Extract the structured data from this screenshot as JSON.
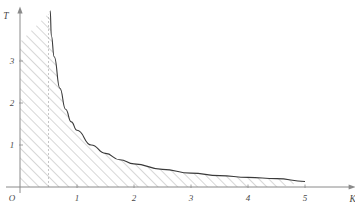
{
  "chart_data": {
    "type": "area",
    "title": "",
    "xlabel": "K",
    "ylabel": "T",
    "origin_label": "O",
    "grid": false,
    "legend": null,
    "xlim": [
      0,
      5.8
    ],
    "ylim": [
      0,
      4.2
    ],
    "xticks": [
      1,
      2,
      3,
      4,
      5
    ],
    "xtick_labels": [
      "1",
      "2",
      "3",
      "4",
      "5"
    ],
    "yticks": [
      1,
      2,
      3
    ],
    "ytick_labels": [
      "1",
      "2",
      "3"
    ],
    "curve": {
      "name": "T = 0.675 / (K - 0.42)",
      "description": "decaying hyperbola with vertical asymptote near K = 0.5",
      "asymptote_x": 0.5,
      "x_start": 0.53,
      "x_end": 5.0,
      "points": [
        {
          "x": 0.53,
          "y": 4.2
        },
        {
          "x": 0.55,
          "y": 3.6
        },
        {
          "x": 0.6,
          "y": 3.1
        },
        {
          "x": 0.7,
          "y": 2.35
        },
        {
          "x": 0.8,
          "y": 1.85
        },
        {
          "x": 0.9,
          "y": 1.55
        },
        {
          "x": 1.0,
          "y": 1.35
        },
        {
          "x": 1.25,
          "y": 1.0
        },
        {
          "x": 1.5,
          "y": 0.8
        },
        {
          "x": 1.75,
          "y": 0.65
        },
        {
          "x": 2.0,
          "y": 0.55
        },
        {
          "x": 2.5,
          "y": 0.42
        },
        {
          "x": 3.0,
          "y": 0.33
        },
        {
          "x": 3.5,
          "y": 0.27
        },
        {
          "x": 4.0,
          "y": 0.23
        },
        {
          "x": 4.5,
          "y": 0.2
        },
        {
          "x": 5.0,
          "y": 0.13
        }
      ]
    },
    "shaded_region": {
      "style": "diagonal-hatch",
      "label": "",
      "bounded_by": [
        "y-axis",
        "x-axis",
        "curve"
      ],
      "x_from": 0.0,
      "x_to": 4.6,
      "top_left_y": 3.45
    },
    "annotations": [
      {
        "type": "vertical-dashed-line",
        "x": 0.5,
        "label": ""
      }
    ]
  },
  "axes": {
    "x_label": "K",
    "y_label": "T",
    "origin": "O"
  },
  "colors": {
    "axis": "#8a8a8a",
    "curve": "#3a3a3a",
    "hatch": "#9a9a9a",
    "text": "#4a4a4a",
    "background": "#ffffff"
  }
}
